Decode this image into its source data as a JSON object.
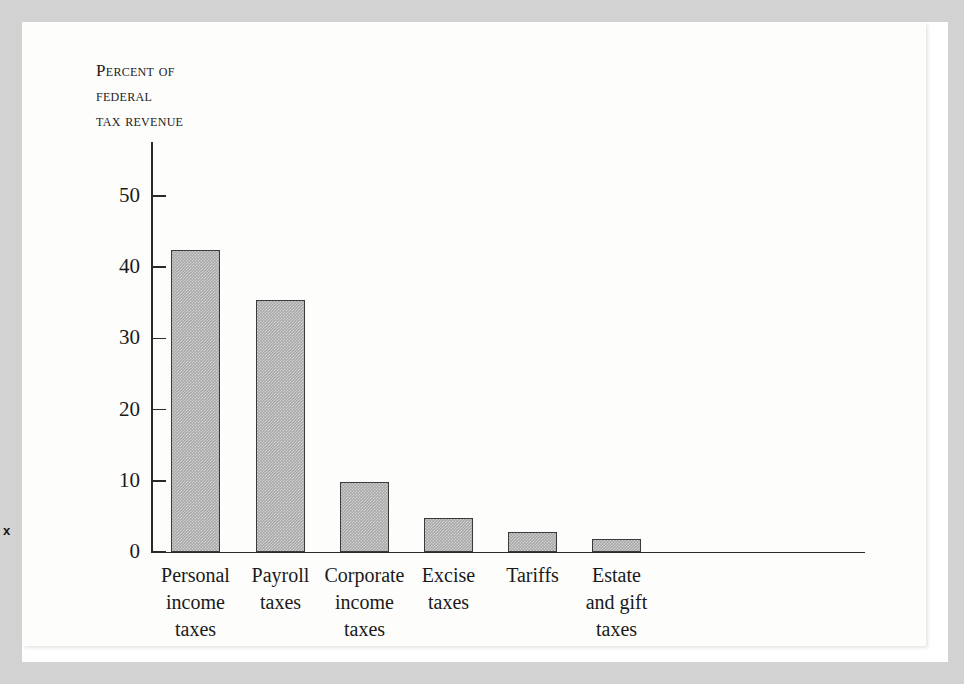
{
  "figure": {
    "margin_mark": "x",
    "axis_title_lines": [
      "Percent of",
      "federal",
      "tax revenue"
    ]
  },
  "chart_data": {
    "type": "bar",
    "title": "",
    "subtitle": "",
    "xlabel": "",
    "ylabel": "Percent of federal tax revenue",
    "ylim": [
      0,
      52
    ],
    "yticks": [
      0,
      10,
      20,
      30,
      40,
      50
    ],
    "ytick_labels": [
      "0",
      "10",
      "20",
      "30",
      "40",
      "50"
    ],
    "grid": false,
    "legend": false,
    "legend_position": "none",
    "categories": [
      "Personal income taxes",
      "Payroll taxes",
      "Corporate income taxes",
      "Excise taxes",
      "Tariffs",
      "Estate and gift taxes"
    ],
    "category_label_lines": [
      [
        "Personal",
        "income",
        "taxes"
      ],
      [
        "Payroll",
        "taxes"
      ],
      [
        "Corporate",
        "income",
        "taxes"
      ],
      [
        "Excise",
        "taxes"
      ],
      [
        "Tariffs"
      ],
      [
        "Estate",
        "and gift",
        "taxes"
      ]
    ],
    "values": [
      42.4,
      35.4,
      9.8,
      4.8,
      2.8,
      1.8
    ],
    "bar_color": "#a9a9a9",
    "bar_edge_color": "#3a3a3a",
    "axis_color": "#2a2a2a"
  }
}
